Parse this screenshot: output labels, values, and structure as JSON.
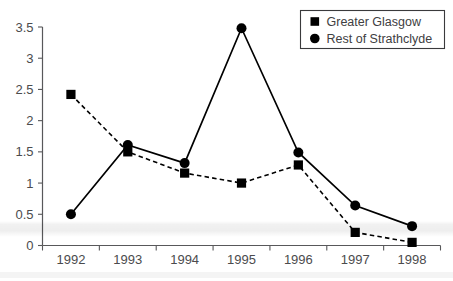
{
  "chart_data": {
    "type": "line",
    "title": "",
    "xlabel": "",
    "ylabel": "",
    "categories": [
      "1992",
      "1993",
      "1994",
      "1995",
      "1996",
      "1997",
      "1998"
    ],
    "ylim": [
      0,
      3.5
    ],
    "yticks": [
      "0",
      "0.5",
      "1",
      "1.5",
      "2",
      "2.5",
      "3",
      "3.5"
    ],
    "ytick_values": [
      0,
      0.5,
      1,
      1.5,
      2,
      2.5,
      3,
      3.5
    ],
    "grid": false,
    "legend_position": "top-right",
    "series": [
      {
        "name": "Greater Glasgow",
        "marker": "square",
        "linestyle": "dashed",
        "color": "#000000",
        "values": [
          2.42,
          1.5,
          1.16,
          1.0,
          1.29,
          0.21,
          0.05
        ]
      },
      {
        "name": "Rest of Strathclyde",
        "marker": "circle",
        "linestyle": "solid",
        "color": "#000000",
        "values": [
          0.5,
          1.61,
          1.32,
          3.48,
          1.49,
          0.64,
          0.31
        ]
      }
    ]
  },
  "legend": {
    "items": [
      {
        "label": "Greater Glasgow",
        "marker": "square"
      },
      {
        "label": "Rest of Strathclyde",
        "marker": "circle"
      }
    ]
  },
  "colors": {
    "axis": "#58585a",
    "tick_text": "#4b4b4d",
    "series": "#000000",
    "legend_border": "#3a3a3c",
    "background": "#ffffff"
  }
}
